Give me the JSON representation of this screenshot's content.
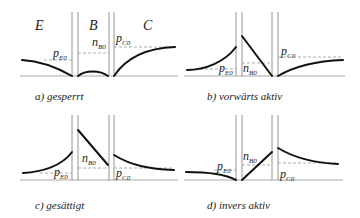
{
  "figure": {
    "regions": {
      "emitter": "E",
      "base": "B",
      "collector": "C"
    },
    "labels": {
      "p_e0": {
        "main": "p",
        "sub": "E0"
      },
      "n_b0": {
        "main": "n",
        "sub": "B0"
      },
      "p_c0": {
        "main": "p",
        "sub": "C0"
      }
    },
    "panels": [
      {
        "id": "a",
        "caption": "a) gesperrt"
      },
      {
        "id": "b",
        "caption": "b) vorwärts aktiv"
      },
      {
        "id": "c",
        "caption": "c) gesättigt"
      },
      {
        "id": "d",
        "caption": "d) invers aktiv"
      }
    ],
    "colors": {
      "curve": "#111111",
      "axis": "#a8a8a8",
      "dashed": "#9a9a9a"
    }
  }
}
